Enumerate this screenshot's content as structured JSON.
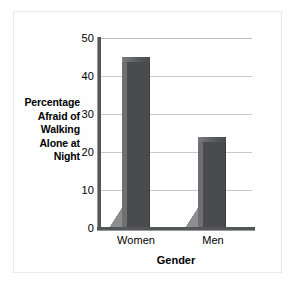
{
  "chart_data": {
    "type": "bar",
    "title": "",
    "categories": [
      "Women",
      "Men"
    ],
    "values": [
      45,
      24
    ],
    "xlabel": "Gender",
    "ylabel": "Percentage Afraid of Walking Alone at Night",
    "ylim": [
      0,
      50
    ],
    "yticks": [
      0,
      10,
      20,
      30,
      40,
      50
    ],
    "ytick_labels": [
      "0",
      "10",
      "20",
      "30",
      "40",
      "50"
    ],
    "grid": true,
    "grid_axis": "y",
    "legend": false,
    "bar_style": "3d",
    "colors": {
      "bar_face": "#4a4b4f",
      "bar_side": "#6e6f73",
      "bar_top": "#5a5b5f",
      "shadow": "#8e8e8e",
      "gridline": "#c9c9c9",
      "axis": "#55565a",
      "background": "#ffffff",
      "frame": "#e9e9e9",
      "text": "#000000"
    }
  },
  "axes": {
    "ylabel_lines": [
      "Percentage",
      "Afraid of",
      "Walking",
      "Alone at",
      "Night"
    ],
    "xlabel": "Gender"
  },
  "yticks": {
    "t0": "0",
    "t1": "10",
    "t2": "20",
    "t3": "30",
    "t4": "40",
    "t5": "50"
  },
  "xticks": {
    "c0": "Women",
    "c1": "Men"
  }
}
